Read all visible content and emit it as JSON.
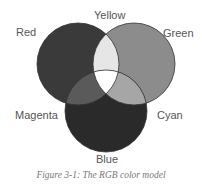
{
  "diagram": {
    "type": "venn",
    "title": "RGB color model",
    "circles": [
      {
        "name": "Red",
        "cx": 78,
        "cy": 64,
        "r": 41,
        "fill": "#3a3a3a"
      },
      {
        "name": "Green",
        "cx": 134,
        "cy": 64,
        "r": 41,
        "fill": "#8c8c8c"
      },
      {
        "name": "Blue",
        "cx": 106,
        "cy": 111,
        "r": 41,
        "fill": "#2a2a2a"
      }
    ],
    "overlaps": {
      "red_green": {
        "name": "Yellow",
        "fill": "#e6e6e6"
      },
      "red_blue": {
        "name": "Magenta",
        "fill": "#5a5a5a"
      },
      "green_blue": {
        "name": "Cyan",
        "fill": "#a6a6a6"
      },
      "all": {
        "name": "White",
        "fill": "#ffffff"
      }
    },
    "stroke": "#333333"
  },
  "labels": {
    "red": "Red",
    "yellow": "Yellow",
    "green": "Green",
    "magenta": "Magenta",
    "cyan": "Cyan",
    "blue": "Blue"
  },
  "caption": "Figure 3-1:  The RGB color model"
}
